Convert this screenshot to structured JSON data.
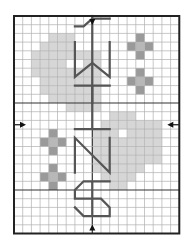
{
  "chart": {
    "title": "",
    "type": "cross-stitch-pattern",
    "text_motif": "1WHNS",
    "letters": [
      "1",
      "W",
      "H",
      "N",
      "S"
    ],
    "orientation": "rotated-vertical",
    "grid": {
      "cols": 19,
      "rows": 25,
      "cell_px": 8.7,
      "origin_x": 14,
      "origin_y": 16,
      "bold_every": 10
    },
    "colors": {
      "background": "#ffffff",
      "grid_line": "#b0b0b0",
      "bold_line": "#333333",
      "frame": "#222222",
      "heart_fill": "#d6d6d6",
      "cross_fill": "#9a9a9a",
      "cross_center": "#b8b8b8",
      "backstitch": "#555555",
      "arrow": "#111111"
    },
    "center_markers": [
      "top-arrow",
      "bottom-arrow",
      "left-arrow",
      "right-arrow"
    ]
  },
  "chart_data": {
    "type": "heatmap",
    "title": "",
    "xlabel": "",
    "ylabel": "",
    "grid_cols": 19,
    "grid_rows": 25,
    "shaded_regions": [
      {
        "name": "heart-top-left",
        "shade": "light",
        "cells_approx": "cols 3-9, rows 2-10"
      },
      {
        "name": "heart-bottom-right",
        "shade": "light",
        "cells_approx": "cols 9-16, rows 12-19"
      }
    ],
    "motifs": [
      {
        "name": "cross-1",
        "center_col": 14,
        "center_row": 3
      },
      {
        "name": "cross-2",
        "center_col": 14,
        "center_row": 7
      },
      {
        "name": "cross-3",
        "center_col": 4,
        "center_row": 14
      },
      {
        "name": "cross-4",
        "center_col": 4,
        "center_row": 18
      }
    ]
  }
}
